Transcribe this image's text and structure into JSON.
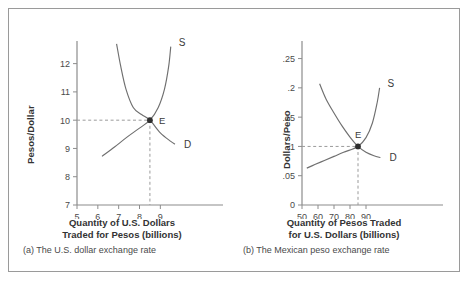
{
  "figure": {
    "border_color": "#9a9a9a",
    "background": "#ffffff"
  },
  "chart_data": [
    {
      "type": "line",
      "panel_id": "a",
      "title": "",
      "caption": "(a) The U.S. dollar exchange rate",
      "xlabel_line1": "Quantity of U.S. Dollars",
      "xlabel_line2": "Traded for Pesos (billions)",
      "ylabel": "Pesos/Dollar",
      "xlim": [
        5,
        9.8
      ],
      "ylim": [
        7,
        12.8
      ],
      "xticks": [
        5,
        6,
        7,
        8,
        9
      ],
      "xtick_labels": [
        "5",
        "6",
        "7",
        "8",
        "9"
      ],
      "yticks": [
        7,
        8,
        9,
        10,
        11,
        12
      ],
      "ytick_labels": [
        "7",
        "8",
        "9",
        "10",
        "11",
        "12"
      ],
      "grid": false,
      "equilibrium": {
        "label": "E",
        "x": 8.5,
        "y": 10
      },
      "series": [
        {
          "name": "S",
          "label": "S",
          "kind": "supply",
          "points": [
            [
              6.2,
              8.72
            ],
            [
              6.8,
              9.05
            ],
            [
              7.4,
              9.4
            ],
            [
              8.0,
              9.72
            ],
            [
              8.5,
              10.0
            ],
            [
              8.9,
              10.45
            ],
            [
              9.2,
              11.1
            ],
            [
              9.4,
              11.9
            ],
            [
              9.5,
              12.6
            ]
          ]
        },
        {
          "name": "D",
          "label": "D",
          "kind": "demand",
          "points": [
            [
              6.9,
              12.7
            ],
            [
              7.1,
              11.9
            ],
            [
              7.35,
              11.1
            ],
            [
              7.7,
              10.45
            ],
            [
              8.1,
              10.2
            ],
            [
              8.5,
              10.0
            ],
            [
              9.0,
              9.55
            ],
            [
              9.5,
              9.25
            ],
            [
              9.7,
              9.15
            ]
          ]
        }
      ]
    },
    {
      "type": "line",
      "panel_id": "b",
      "title": "",
      "caption": "(b) The Mexican peso exchange rate",
      "xlabel_line1": "Quantity of Pesos Traded",
      "xlabel_line2": "for U.S. Dollars (billions)",
      "ylabel": "Dollars/Peso",
      "xlim": [
        50,
        100
      ],
      "ylim": [
        0,
        0.28
      ],
      "xticks": [
        50,
        60,
        70,
        80,
        90
      ],
      "xtick_labels": [
        "50",
        "60",
        "70",
        "80",
        "90"
      ],
      "yticks": [
        0,
        0.05,
        0.1,
        0.15,
        0.2,
        0.25
      ],
      "ytick_labels": [
        "0",
        ".05",
        ".1",
        ".15",
        ".2",
        ".25"
      ],
      "grid": false,
      "equilibrium": {
        "label": "E",
        "x": 85,
        "y": 0.1
      },
      "series": [
        {
          "name": "S",
          "label": "S",
          "kind": "supply",
          "points": [
            [
              53,
              0.063
            ],
            [
              58,
              0.069
            ],
            [
              64,
              0.076
            ],
            [
              70,
              0.083
            ],
            [
              76,
              0.09
            ],
            [
              85,
              0.1
            ],
            [
              90,
              0.115
            ],
            [
              94,
              0.14
            ],
            [
              97,
              0.175
            ],
            [
              98.5,
              0.2
            ]
          ]
        },
        {
          "name": "D",
          "label": "D",
          "kind": "demand",
          "points": [
            [
              61,
              0.207
            ],
            [
              65,
              0.181
            ],
            [
              70,
              0.157
            ],
            [
              75,
              0.135
            ],
            [
              80,
              0.116
            ],
            [
              85,
              0.1
            ],
            [
              90,
              0.09
            ],
            [
              95,
              0.084
            ],
            [
              99,
              0.081
            ]
          ]
        }
      ]
    }
  ]
}
